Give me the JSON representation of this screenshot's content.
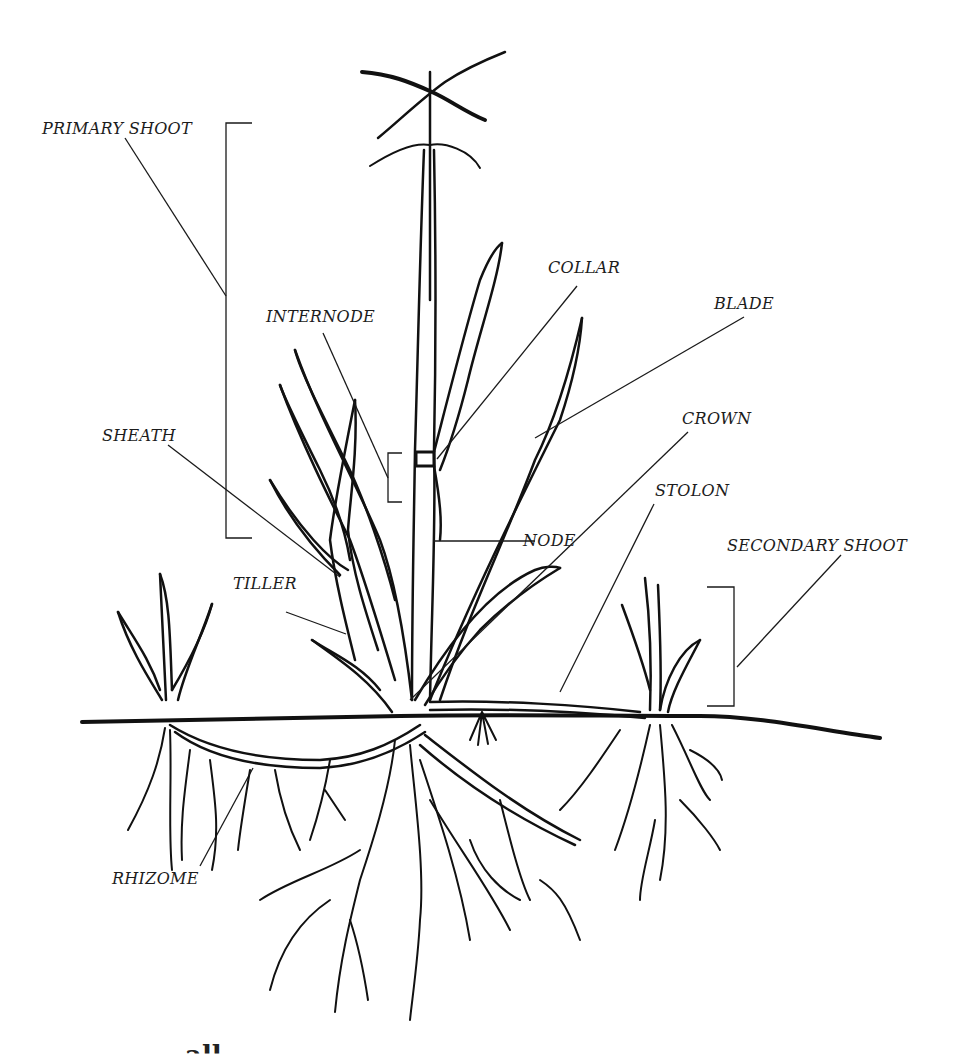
{
  "diagram": {
    "labels": {
      "primary_shoot": "PRIMARY SHOOT",
      "internode": "INTERNODE",
      "collar": "COLLAR",
      "blade": "BLADE",
      "sheath": "SHEATH",
      "crown": "CROWN",
      "stolon": "STOLON",
      "node": "NODE",
      "secondary_shoot": "SECONDARY SHOOT",
      "tiller": "TILLER",
      "rhizome": "RHIZOME"
    },
    "colors": {
      "ink": "#111111",
      "label": "#1c1c1c",
      "background": "#ffffff"
    }
  },
  "footer": {
    "partial_caption": "… all … … …"
  }
}
